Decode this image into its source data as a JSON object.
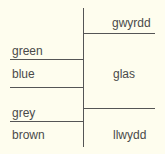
{
  "diagram": {
    "title": "",
    "left_column": {
      "labels": [
        "green",
        "blue",
        "grey",
        "brown"
      ]
    },
    "right_column": {
      "labels": [
        "gwyrdd",
        "glas",
        "llwydd"
      ]
    },
    "colors": {
      "background": "#fefdee",
      "line": "#555555",
      "text": "#4a4a4a"
    }
  }
}
